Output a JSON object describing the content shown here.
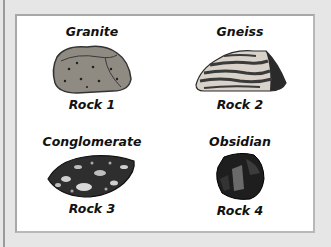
{
  "rocks": [
    {
      "name": "Granite",
      "label": "Rock 1",
      "icon": "granite-rock-icon"
    },
    {
      "name": "Gneiss",
      "label": "Rock 2",
      "icon": "gneiss-rock-icon"
    },
    {
      "name": "Conglomerate",
      "label": "Rock 3",
      "icon": "conglomerate-rock-icon"
    },
    {
      "name": "Obsidian",
      "label": "Rock 4",
      "icon": "obsidian-rock-icon"
    }
  ],
  "colors": {
    "background": "#e6e6e6",
    "panel": "#ffffff",
    "text": "#111111"
  }
}
